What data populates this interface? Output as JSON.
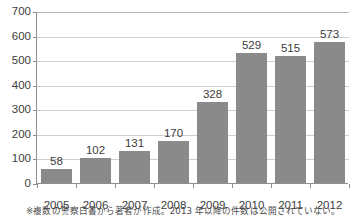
{
  "figure": {
    "title_cut_off": "",
    "footnote": "※複数の警察白書から著者が作成。2013 年以降の件数は公開されていない。",
    "bar_color": "#8a8a8a",
    "gridline_color": "#cfcfcf",
    "axis_color": "#8f8f8f",
    "background": "#ffffff",
    "text_color": "#3c3c3c"
  },
  "chart_data": {
    "type": "bar",
    "title": "",
    "xlabel": "",
    "ylabel": "",
    "categories": [
      "2005",
      "2006",
      "2007",
      "2008",
      "2009",
      "2010",
      "2011",
      "2012"
    ],
    "values": [
      58,
      102,
      131,
      170,
      328,
      529,
      515,
      573
    ],
    "value_labels": [
      "58",
      "102",
      "131",
      "170",
      "328",
      "529",
      "515",
      "573"
    ],
    "ylim": [
      0,
      700
    ],
    "yticks": [
      0,
      100,
      200,
      300,
      400,
      500,
      600,
      700
    ],
    "ytick_labels": [
      "0",
      "100",
      "200",
      "300",
      "400",
      "500",
      "600",
      "700"
    ],
    "grid": true,
    "grid_axis": "y",
    "legend": null,
    "legend_position": "none",
    "series": [
      {
        "name": "件数",
        "values": [
          58,
          102,
          131,
          170,
          328,
          529,
          515,
          573
        ]
      }
    ],
    "annotations": [
      "※複数の警察白書から著者が作成。2013 年以降の件数は公開されていない。"
    ]
  }
}
